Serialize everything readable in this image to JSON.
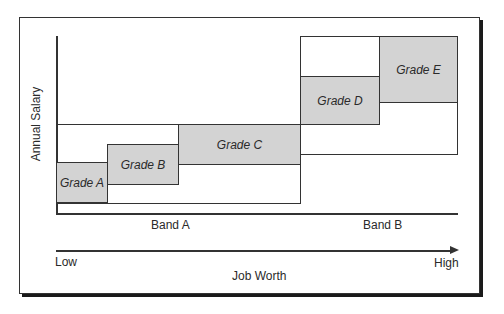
{
  "diagram": {
    "y_axis_label": "Annual Salary",
    "x_axis_label": "Job Worth",
    "x_axis_low": "Low",
    "x_axis_high": "High",
    "bands": [
      {
        "label": "Band A"
      },
      {
        "label": "Band B"
      }
    ],
    "grades": [
      {
        "label": "Grade A",
        "band": "Band A"
      },
      {
        "label": "Grade B",
        "band": "Band A"
      },
      {
        "label": "Grade C",
        "band": "Band A"
      },
      {
        "label": "Grade D",
        "band": "Band B"
      },
      {
        "label": "Grade E",
        "band": "Band B"
      }
    ],
    "colors": {
      "grade_fill": "#d3d3d3",
      "line": "#333333",
      "background": "#ffffff"
    }
  }
}
